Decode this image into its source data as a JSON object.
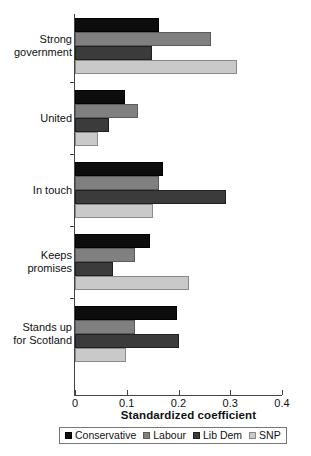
{
  "chart_data": {
    "type": "bar",
    "orientation": "horizontal",
    "title": "",
    "xlabel": "Standardized coefficient",
    "ylabel": "",
    "xlim": [
      0,
      0.4
    ],
    "xticks": [
      "0",
      "0.1",
      "0.2",
      "0.3",
      "0.4"
    ],
    "xtick_values": [
      0,
      0.1,
      0.2,
      0.3,
      0.4
    ],
    "grid": false,
    "legend_position": "bottom",
    "categories": [
      "Strong\ngovernment",
      "United",
      "In touch",
      "Keeps\npromises",
      "Stands up\nfor Scotland"
    ],
    "series": [
      {
        "name": "Conservative",
        "color": "#0d0d0d",
        "values": [
          0.162,
          0.097,
          0.17,
          0.145,
          0.197
        ]
      },
      {
        "name": "Labour",
        "color": "#808080",
        "values": [
          0.263,
          0.122,
          0.162,
          0.116,
          0.116
        ]
      },
      {
        "name": "Lib Dem",
        "color": "#3b3b3b",
        "values": [
          0.149,
          0.066,
          0.292,
          0.073,
          0.201
        ]
      },
      {
        "name": "SNP",
        "color": "#c9c9c9",
        "values": [
          0.313,
          0.045,
          0.151,
          0.22,
          0.099
        ]
      }
    ]
  }
}
